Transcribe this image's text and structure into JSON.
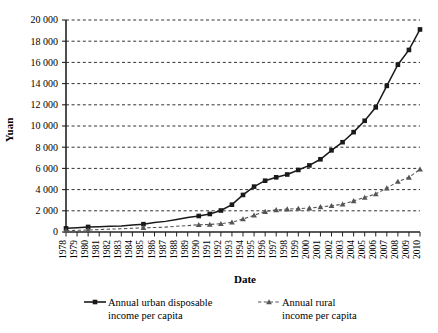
{
  "chart_data": {
    "type": "line",
    "title": "",
    "xlabel": "Date",
    "ylabel": "Yuan",
    "ylim": [
      0,
      20000
    ],
    "ytick_step": 2000,
    "ytick_labels": [
      "0",
      "2 000",
      "4 000",
      "6 000",
      "8 000",
      "10 000",
      "12 000",
      "14 000",
      "16 000",
      "18 000",
      "20 000"
    ],
    "grid": "horizontal-dashed",
    "legend_position": "bottom",
    "categories": [
      "1978",
      "1979",
      "1980",
      "1981",
      "1982",
      "1983",
      "1984",
      "1985",
      "1986",
      "1987",
      "1988",
      "1989",
      "1990",
      "1991",
      "1992",
      "1993",
      "1994",
      "1995",
      "1996",
      "1997",
      "1998",
      "1999",
      "2000",
      "2001",
      "2002",
      "2003",
      "2004",
      "2005",
      "2006",
      "2007",
      "2008",
      "2009",
      "2010"
    ],
    "series": [
      {
        "name": "Annual urban disposable income per capita",
        "marker": "square",
        "line": "solid",
        "color": "#1a1a1a",
        "values": [
          343,
          405,
          478,
          500,
          535,
          565,
          652,
          739,
          900,
          1002,
          1181,
          1376,
          1510,
          1701,
          2027,
          2577,
          3496,
          4283,
          4839,
          5160,
          5425,
          5854,
          6280,
          6860,
          7703,
          8472,
          9422,
          10493,
          11760,
          13786,
          15781,
          17175,
          19109
        ]
      },
      {
        "name": "Annual rural income per capita",
        "marker": "triangle",
        "line": "dashed",
        "color": "#555555",
        "values": [
          134,
          160,
          191,
          223,
          270,
          310,
          355,
          398,
          424,
          463,
          545,
          602,
          686,
          709,
          784,
          922,
          1221,
          1578,
          1926,
          2090,
          2162,
          2210,
          2253,
          2366,
          2476,
          2622,
          2936,
          3255,
          3587,
          4140,
          4761,
          5153,
          5919
        ]
      }
    ],
    "legend": [
      {
        "label_line1": "Annual urban disposable",
        "label_line2": "income per capita",
        "marker": "square",
        "line": "solid"
      },
      {
        "label_line1": "Annual rural",
        "label_line2": "income per capita",
        "marker": "triangle",
        "line": "dashed"
      }
    ]
  }
}
